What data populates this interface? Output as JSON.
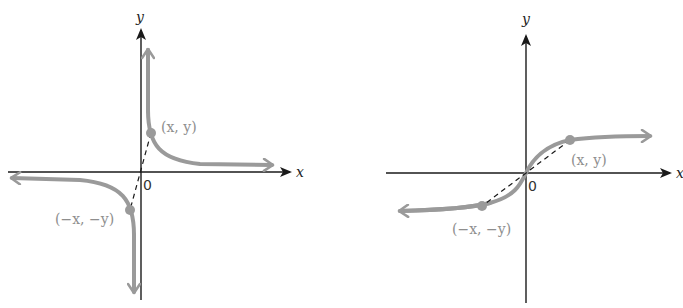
{
  "figures": [
    {
      "id": "odd-function-hyperbola",
      "x_axis_label": "x",
      "y_axis_label": "y",
      "origin_label": "0",
      "point_label": "(x, y)",
      "reflected_point_label": "(−x, −y)"
    },
    {
      "id": "odd-function-s-curve",
      "x_axis_label": "x",
      "y_axis_label": "y",
      "origin_label": "0",
      "point_label": "(x, y)",
      "reflected_point_label": "(−x, −y)"
    }
  ],
  "colors": {
    "axis": "#1a1a1a",
    "curve": "#9a9a9a",
    "label_gray": "#8e8e8e"
  }
}
